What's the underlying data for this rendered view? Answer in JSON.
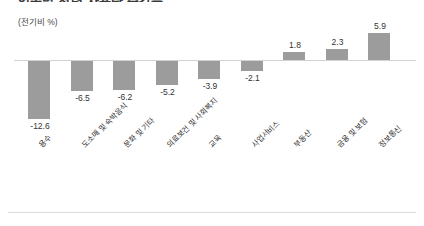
{
  "chart_data": {
    "type": "bar",
    "title": "업종별 전력 사용량 증감률",
    "subtitle": "",
    "unit_label": "(전기비 %)",
    "xlabel": "",
    "ylabel": "",
    "ylim": [
      -14,
      7
    ],
    "grid": false,
    "legend": "none",
    "zero_line": true,
    "bar_color": "#9c9c9c",
    "categories": [
      "용수",
      "도소매 및 숙박음식",
      "문화 및 기타",
      "의료보건 및 사회복지",
      "교육",
      "사업서비스",
      "부동산",
      "금융 및 보험",
      "정보통신"
    ],
    "values": [
      -12.6,
      -6.5,
      -6.2,
      -5.2,
      -3.9,
      -2.1,
      1.8,
      2.3,
      5.9
    ],
    "value_labels": [
      "-12.6",
      "-6.5",
      "-6.2",
      "-5.2",
      "-3.9",
      "-2.1",
      "1.8",
      "2.3",
      "5.9"
    ]
  }
}
